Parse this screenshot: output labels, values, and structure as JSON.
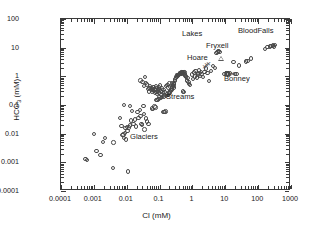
{
  "figure": {
    "type": "scatter-loglog",
    "background": "#ffffff",
    "frame_color": "#3a3a3a",
    "marker_color": "#4a4a4a"
  },
  "axis_titles": {
    "x_main": "Cl",
    "x_unit": "(mM)",
    "y_main": "HCO",
    "y_sub": "3",
    "y_unit": "(mM)"
  },
  "ticks": {
    "x_labels": [
      "0.0001",
      "0.001",
      "0.01",
      "0.1",
      "1",
      "10",
      "100",
      "1000"
    ],
    "y_labels": [
      "0.0001",
      "0.001",
      "0.01",
      "0.1",
      "1",
      "10",
      "100"
    ]
  },
  "annotations": [
    {
      "text": "Lakes",
      "x": 182,
      "y": 29
    },
    {
      "text": "BloodFalls",
      "x": 238,
      "y": 26
    },
    {
      "text": "Fryxell",
      "x": 206,
      "y": 41
    },
    {
      "text": "Hoare",
      "x": 187,
      "y": 53
    },
    {
      "text": "Bonney",
      "x": 224,
      "y": 74
    },
    {
      "text": "Streams",
      "x": 166,
      "y": 92
    },
    {
      "text": "Glaciers",
      "x": 130,
      "y": 132
    }
  ],
  "chart_data": {
    "type": "scatter",
    "title": "",
    "xlabel": "Cl (mM)",
    "ylabel": "HCO3 (mM)",
    "xscale": "log",
    "yscale": "log",
    "xlim": [
      0.0001,
      1000
    ],
    "ylim": [
      0.0001,
      100
    ],
    "grid": false,
    "legend": null,
    "groups": [
      {
        "name": "Glaciers",
        "marker": "open-circle",
        "points": [
          [
            0.00055,
            0.0013
          ],
          [
            0.00062,
            0.0012
          ],
          [
            0.001,
            0.0098
          ],
          [
            0.0012,
            0.0025
          ],
          [
            0.0016,
            0.0018
          ],
          [
            0.0019,
            0.0052
          ],
          [
            0.0022,
            0.0071
          ],
          [
            0.0038,
            0.00065
          ],
          [
            0.004,
            0.005
          ],
          [
            0.0075,
            0.0088
          ],
          [
            0.008,
            0.0093
          ],
          [
            0.0082,
            0.0072
          ],
          [
            0.0088,
            0.0105
          ],
          [
            0.0092,
            0.016
          ],
          [
            0.0095,
            0.0062
          ],
          [
            0.01,
            0.0175
          ],
          [
            0.0105,
            0.0122
          ],
          [
            0.011,
            0.00048
          ],
          [
            0.0115,
            0.0165
          ],
          [
            0.0125,
            0.0195
          ],
          [
            0.0135,
            0.029
          ],
          [
            0.0062,
            0.036
          ],
          [
            0.007,
            0.0185
          ],
          [
            0.016,
            0.0215
          ],
          [
            0.0175,
            0.0315
          ],
          [
            0.019,
            0.018
          ],
          [
            0.021,
            0.056
          ],
          [
            0.023,
            0.0345
          ],
          [
            0.0082,
            0.0985
          ],
          [
            0.0125,
            0.093
          ],
          [
            0.0145,
            0.062
          ],
          [
            0.025,
            0.068
          ],
          [
            0.026,
            0.042
          ],
          [
            0.0285,
            0.0215
          ],
          [
            0.032,
            0.092
          ],
          [
            0.033,
            0.0485
          ],
          [
            0.038,
            0.034
          ],
          [
            0.042,
            0.0265
          ],
          [
            0.046,
            0.0215
          ],
          [
            0.029,
            0.0205
          ],
          [
            0.035,
            0.0142
          ]
        ]
      },
      {
        "name": "Streams",
        "marker": "open-circle",
        "points": [
          [
            0.038,
            0.58
          ],
          [
            0.041,
            0.52
          ],
          [
            0.045,
            0.36
          ],
          [
            0.048,
            0.3
          ],
          [
            0.05,
            0.4
          ],
          [
            0.052,
            0.45
          ],
          [
            0.055,
            0.33
          ],
          [
            0.058,
            0.38
          ],
          [
            0.06,
            0.28
          ],
          [
            0.062,
            0.35
          ],
          [
            0.065,
            0.42
          ],
          [
            0.068,
            0.31
          ],
          [
            0.07,
            0.37
          ],
          [
            0.072,
            0.26
          ],
          [
            0.075,
            0.34
          ],
          [
            0.078,
            0.44
          ],
          [
            0.08,
            0.29
          ],
          [
            0.082,
            0.39
          ],
          [
            0.085,
            0.24
          ],
          [
            0.088,
            0.36
          ],
          [
            0.09,
            0.32
          ],
          [
            0.095,
            0.41
          ],
          [
            0.098,
            0.27
          ],
          [
            0.1,
            0.35
          ],
          [
            0.105,
            0.48
          ],
          [
            0.11,
            0.3
          ],
          [
            0.115,
            0.22
          ],
          [
            0.12,
            0.38
          ],
          [
            0.125,
            0.26
          ],
          [
            0.13,
            0.33
          ],
          [
            0.135,
            0.2
          ],
          [
            0.14,
            0.29
          ],
          [
            0.058,
            0.075
          ],
          [
            0.062,
            0.072
          ],
          [
            0.07,
            0.088
          ],
          [
            0.075,
            0.082
          ],
          [
            0.08,
            0.152
          ],
          [
            0.086,
            0.148
          ],
          [
            0.092,
            0.165
          ],
          [
            0.1,
            0.185
          ],
          [
            0.11,
            0.175
          ],
          [
            0.12,
            0.195
          ],
          [
            0.13,
            0.058
          ],
          [
            0.14,
            0.056
          ],
          [
            0.15,
            0.06
          ],
          [
            0.16,
            0.21
          ],
          [
            0.17,
            0.235
          ],
          [
            0.18,
            0.22
          ],
          [
            0.19,
            0.25
          ],
          [
            0.2,
            0.275
          ],
          [
            0.21,
            0.3
          ],
          [
            0.22,
            0.32
          ],
          [
            0.23,
            0.34
          ],
          [
            0.24,
            0.38
          ],
          [
            0.25,
            0.42
          ],
          [
            0.26,
            0.46
          ],
          [
            0.27,
            0.52
          ],
          [
            0.28,
            0.6
          ],
          [
            0.29,
            0.68
          ],
          [
            0.3,
            0.78
          ],
          [
            0.32,
            0.88
          ],
          [
            0.34,
            0.95
          ],
          [
            0.36,
            1.05
          ],
          [
            0.38,
            1.12
          ],
          [
            0.4,
            1.2
          ],
          [
            0.42,
            1.28
          ],
          [
            0.44,
            1.18
          ],
          [
            0.46,
            1.35
          ],
          [
            0.48,
            1.25
          ],
          [
            0.5,
            1.4
          ],
          [
            0.52,
            1.3
          ],
          [
            0.54,
            1.45
          ],
          [
            0.56,
            1.22
          ],
          [
            0.58,
            1.38
          ],
          [
            0.6,
            1.15
          ],
          [
            0.62,
            1.05
          ],
          [
            0.65,
            0.95
          ],
          [
            0.68,
            0.72
          ],
          [
            0.7,
            0.86
          ],
          [
            0.75,
            0.62
          ],
          [
            0.8,
            0.55
          ],
          [
            0.85,
            0.5
          ],
          [
            0.52,
            0.3
          ],
          [
            0.56,
            0.28
          ],
          [
            0.026,
            0.72
          ],
          [
            0.03,
            0.62
          ],
          [
            0.033,
            0.45
          ],
          [
            0.036,
            0.95
          ],
          [
            0.16,
            0.46
          ],
          [
            0.175,
            0.5
          ],
          [
            0.185,
            0.41
          ],
          [
            0.2,
            0.56
          ],
          [
            0.215,
            0.44
          ],
          [
            0.235,
            0.6
          ],
          [
            0.255,
            0.5
          ],
          [
            0.275,
            0.41
          ]
        ]
      },
      {
        "name": "Fryxell",
        "marker": "open-circle",
        "points": [
          [
            1.05,
            0.8
          ],
          [
            1.2,
            1.0
          ],
          [
            1.35,
            0.92
          ],
          [
            1.5,
            1.15
          ],
          [
            1.7,
            1.05
          ],
          [
            1.9,
            1.22
          ],
          [
            2.1,
            0.95
          ],
          [
            2.3,
            1.4
          ],
          [
            2.6,
            1.85
          ],
          [
            2.9,
            1.3
          ],
          [
            3.2,
            0.7
          ],
          [
            3.6,
            1.55
          ],
          [
            4.2,
            2.3
          ],
          [
            4.8,
            2.0
          ],
          [
            5.4,
            6.5
          ],
          [
            5.8,
            7.2
          ],
          [
            6.2,
            7.8
          ],
          [
            6.6,
            7.0
          ]
        ]
      },
      {
        "name": "Hoare",
        "marker": "open-circle",
        "points": [
          [
            0.95,
            1.15
          ],
          [
            1.1,
            1.35
          ],
          [
            1.25,
            1.5
          ],
          [
            1.45,
            1.28
          ],
          [
            1.6,
            1.6
          ],
          [
            1.8,
            1.42
          ]
        ]
      },
      {
        "name": "Bonney",
        "marker": "open-circle",
        "points": [
          [
            9.5,
            1.2
          ],
          [
            11.0,
            1.25
          ],
          [
            12.5,
            1.15
          ],
          [
            14.0,
            1.3
          ],
          [
            20.0,
            1.2
          ],
          [
            22.0,
            1.22
          ],
          [
            18.0,
            3.2
          ],
          [
            26.0,
            2.4
          ],
          [
            42.0,
            3.3
          ],
          [
            48.0,
            3.5
          ],
          [
            60.0,
            4.2
          ]
        ]
      },
      {
        "name": "BloodFalls",
        "marker": "open-circle",
        "points": [
          [
            160.0,
            9.0
          ],
          [
            195.0,
            10.5
          ],
          [
            230.0,
            11.0
          ],
          [
            255.0,
            11.5
          ],
          [
            280.0,
            12.0
          ],
          [
            300.0,
            11.0
          ],
          [
            320.0,
            12.5
          ]
        ]
      },
      {
        "name": "Special-markers",
        "marker": "mixed",
        "points": [
          [
            7.2,
            4.0,
            "tri"
          ],
          [
            11.5,
            1.25,
            "sq"
          ],
          [
            12.2,
            1.18,
            "sq"
          ],
          [
            16.5,
            1.2,
            "cross"
          ],
          [
            2.4,
            2.1,
            "cross"
          ],
          [
            2.7,
            2.35,
            "cross"
          ],
          [
            3.0,
            2.55,
            "cross"
          ],
          [
            0.42,
            1.3,
            "dot"
          ],
          [
            0.46,
            1.35,
            "dot"
          ],
          [
            0.5,
            1.42,
            "dot"
          ],
          [
            0.34,
            1.1,
            "dot"
          ],
          [
            0.3,
            0.98,
            "dot"
          ]
        ]
      }
    ]
  }
}
